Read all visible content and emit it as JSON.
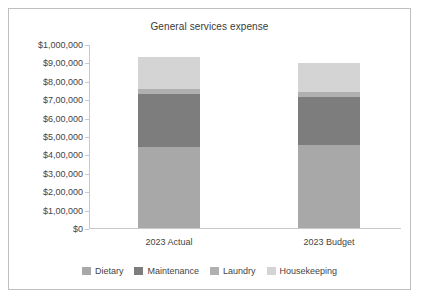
{
  "chart_data": {
    "type": "bar",
    "subtype": "stacked-bar",
    "title": "General services expense",
    "xlabel": "",
    "ylabel": "",
    "ylim": [
      0,
      1000000
    ],
    "grid": false,
    "legend_position": "bottom",
    "categories": [
      "2023 Actual",
      "2023 Budget"
    ],
    "ytick_labels": [
      "$1,000,000",
      "$9,00,000",
      "$8,00,000",
      "$7,00,000",
      "$6,00,000",
      "$5,00,000",
      "$4,00,000",
      "$3,00,000",
      "$2,00,000",
      "$1,00,000",
      "$0"
    ],
    "ytick_values": [
      1000000,
      900000,
      800000,
      700000,
      600000,
      500000,
      400000,
      300000,
      200000,
      100000,
      0
    ],
    "series": [
      {
        "name": "Dietary",
        "color": "#a8a8a8",
        "values": [
          440000,
          450000
        ]
      },
      {
        "name": "Maintenance",
        "color": "#7d7d7d",
        "values": [
          288000,
          262000
        ]
      },
      {
        "name": "Laundry",
        "color": "#b0b0b0",
        "values": [
          27000,
          28000
        ]
      },
      {
        "name": "Housekeeping",
        "color": "#d4d4d4",
        "values": [
          175000,
          157000
        ]
      }
    ],
    "totals": [
      930000,
      897000
    ]
  },
  "colors": {
    "frame_border": "#bfbfbf",
    "axis": "#c9c9c9",
    "text": "#444444",
    "title_text": "#3a3a3a",
    "background": "#ffffff"
  }
}
